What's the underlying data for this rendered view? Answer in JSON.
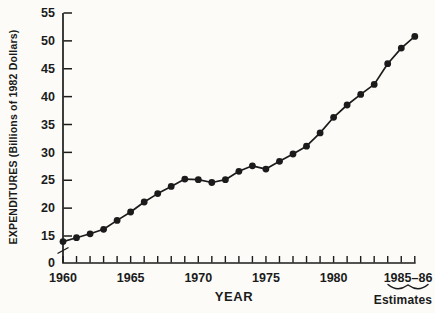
{
  "figure": {
    "background": "#fcfbf8",
    "ink": "#1b1b1b"
  },
  "chart_data": {
    "type": "line",
    "title": "",
    "xlabel": "YEAR",
    "ylabel": "EXPENDITURES (Billions of 1982 Dollars)",
    "x": [
      1960,
      1961,
      1962,
      1963,
      1964,
      1965,
      1966,
      1967,
      1968,
      1969,
      1970,
      1971,
      1972,
      1973,
      1974,
      1975,
      1976,
      1977,
      1978,
      1979,
      1980,
      1981,
      1982,
      1983,
      1984,
      1985,
      1986
    ],
    "values": [
      14.0,
      14.7,
      15.4,
      16.2,
      17.8,
      19.3,
      21.1,
      22.6,
      23.9,
      25.2,
      25.1,
      24.6,
      25.1,
      26.6,
      27.6,
      27.0,
      28.4,
      29.7,
      31.1,
      33.5,
      36.3,
      38.5,
      40.4,
      42.2,
      45.9,
      48.7,
      50.8
    ],
    "series_name": "Expenditures (Billions of 1982 Dollars)",
    "y_ticks": [
      55,
      50,
      45,
      40,
      35,
      30,
      25,
      20,
      15
    ],
    "y_origin_label": "0",
    "y_axis_break": true,
    "ylim": [
      0,
      55
    ],
    "x_tick_labels": [
      {
        "label": "1960",
        "year": 1960
      },
      {
        "label": "1965",
        "year": 1965
      },
      {
        "label": "1970",
        "year": 1970
      },
      {
        "label": "1975",
        "year": 1975
      },
      {
        "label": "1980",
        "year": 1980
      },
      {
        "label": "1985–86",
        "year": 1985.5
      }
    ],
    "annotation": "Estimates",
    "annotation_target": "1985–86",
    "marker": "filled-circle",
    "line_color": "#1b1b1b",
    "grid": false,
    "legend": "none"
  }
}
